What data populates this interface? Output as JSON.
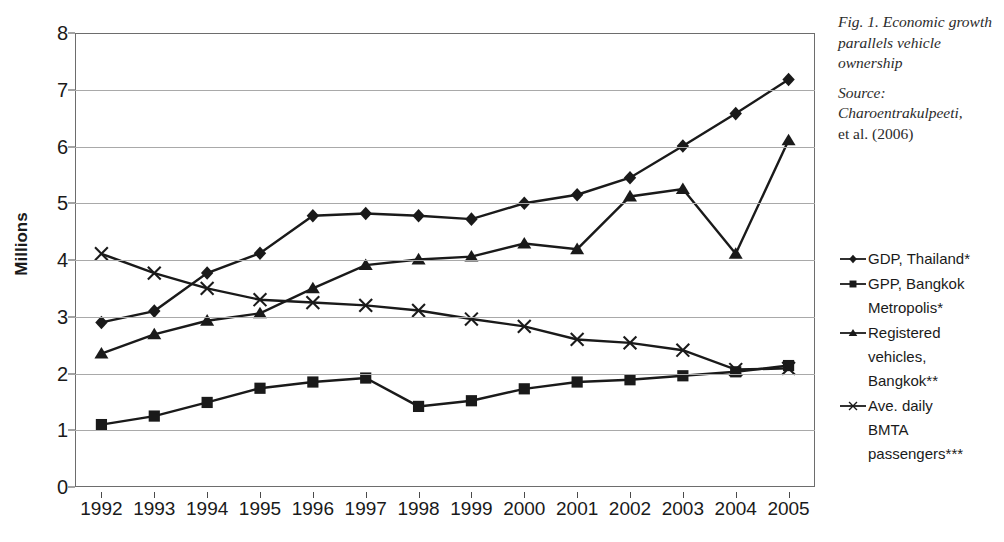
{
  "caption": {
    "title": "Fig. 1. Economic growth parallels vehicle ownership",
    "source_label": "Source:",
    "source_name": "Charoentrakulpeeti,",
    "source_rest": "et al. (2006)"
  },
  "axes": {
    "ylabel": "Millions",
    "yticks": [
      "0",
      "1",
      "2",
      "3",
      "4",
      "5",
      "6",
      "7",
      "8"
    ],
    "xticks": [
      "1992",
      "1993",
      "1994",
      "1995",
      "1996",
      "1997",
      "1998",
      "1999",
      "2000",
      "2001",
      "2002",
      "2003",
      "2004",
      "2005"
    ]
  },
  "legend": {
    "position": "right",
    "items": [
      {
        "label": "GDP, Thailand*",
        "marker": "diamond-marker-icon",
        "color": "#1a1a1a"
      },
      {
        "label": "GPP, Bangkok\nMetropolis*",
        "marker": "square-marker-icon",
        "color": "#1a1a1a"
      },
      {
        "label": "Registered\nvehicles,\nBangkok**",
        "marker": "triangle-marker-icon",
        "color": "#1a1a1a"
      },
      {
        "label": "Ave. daily\nBMTA\npassengers***",
        "marker": "cross-marker-icon",
        "color": "#1a1a1a"
      }
    ]
  },
  "chart_data": {
    "type": "line",
    "title": "Fig. 1. Economic growth parallels vehicle ownership",
    "xlabel": "",
    "ylabel": "Millions",
    "ylim": [
      0,
      8
    ],
    "ytick_step": 1,
    "grid": true,
    "legend_position": "right",
    "categories": [
      "1992",
      "1993",
      "1994",
      "1995",
      "1996",
      "1997",
      "1998",
      "1999",
      "2000",
      "2001",
      "2002",
      "2003",
      "2004",
      "2005"
    ],
    "series": [
      {
        "name": "GDP, Thailand*",
        "marker": "diamond",
        "color": "#1a1a1a",
        "values": [
          2.9,
          3.1,
          3.77,
          4.12,
          4.78,
          4.82,
          4.78,
          4.72,
          5.0,
          5.15,
          5.45,
          6.01,
          6.58,
          7.18
        ]
      },
      {
        "name": "GPP, Bangkok Metropolis*",
        "marker": "square",
        "color": "#1a1a1a",
        "values": [
          1.1,
          1.25,
          1.49,
          1.74,
          1.85,
          1.92,
          1.42,
          1.52,
          1.73,
          1.85,
          1.89,
          1.96,
          2.03,
          2.14
        ]
      },
      {
        "name": "Registered vehicles, Bangkok**",
        "marker": "triangle",
        "color": "#1a1a1a",
        "values": [
          2.35,
          2.69,
          2.93,
          3.06,
          3.5,
          3.91,
          4.01,
          4.06,
          4.29,
          4.19,
          5.12,
          5.25,
          4.11,
          6.11
        ]
      },
      {
        "name": "Ave. daily BMTA passengers***",
        "marker": "cross",
        "color": "#1a1a1a",
        "values": [
          4.11,
          3.77,
          3.5,
          3.3,
          3.25,
          3.2,
          3.11,
          2.96,
          2.83,
          2.6,
          2.54,
          2.41,
          2.07,
          2.09
        ]
      }
    ]
  }
}
